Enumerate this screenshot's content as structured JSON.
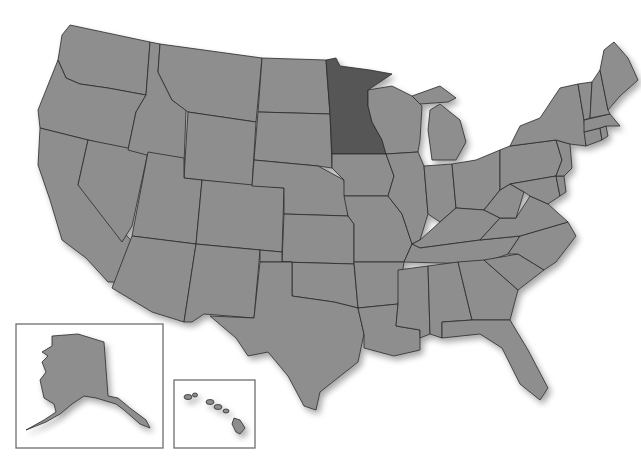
{
  "map": {
    "title": "United States",
    "highlighted_state": "Minnesota",
    "colors": {
      "state_fill": "#8e8e8e",
      "highlight_fill": "#565656",
      "border": "#2a2a2a",
      "background": "#ffffff"
    },
    "insets": [
      {
        "name": "Alaska"
      },
      {
        "name": "Hawaii"
      }
    ]
  }
}
